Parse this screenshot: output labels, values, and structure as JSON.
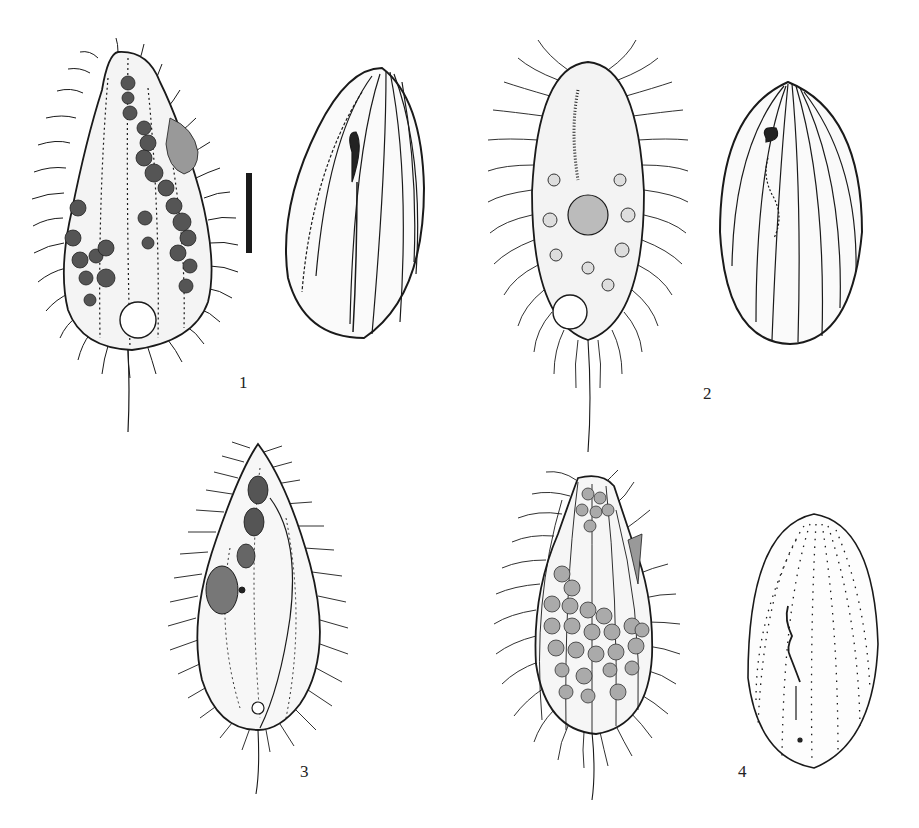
{
  "plate": {
    "type": "scientific illustration plate",
    "subject": "ciliate protozoa line drawings",
    "ink_color": "#1a1a1a",
    "background": "#ffffff"
  },
  "figures": [
    {
      "label": "1",
      "views": [
        "ventral view with cilia, food vacuoles and contractile vacuole",
        "ciliary pattern / kineties view"
      ]
    },
    {
      "label": "2",
      "views": [
        "ventral view with cilia, macronucleus and vacuoles",
        "ciliary pattern / kineties view"
      ]
    },
    {
      "label": "3",
      "views": [
        "lateral view with cilia and oral region"
      ]
    },
    {
      "label": "4",
      "views": [
        "ventral view with cilia and food vacuoles",
        "silverline / dotted kinety pattern view"
      ]
    }
  ],
  "scale_bar": {
    "orientation": "vertical",
    "present": true
  }
}
